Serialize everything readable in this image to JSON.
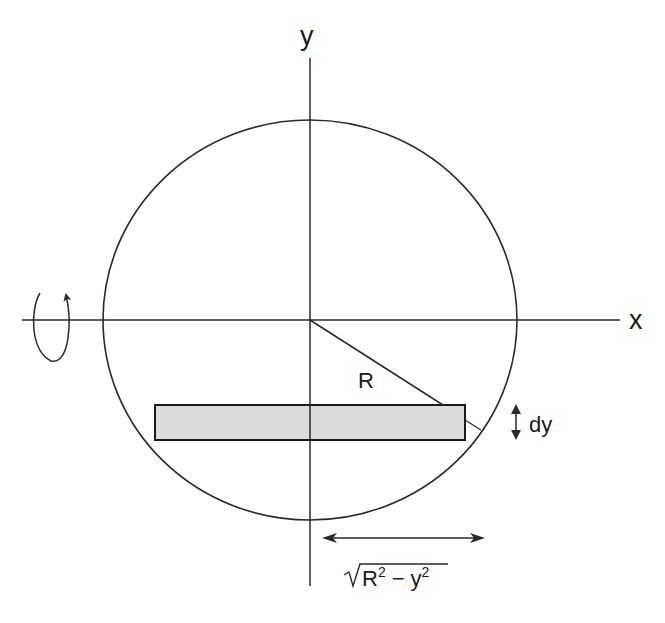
{
  "diagram": {
    "labels": {
      "y_axis": "y",
      "x_axis": "x",
      "radius": "R",
      "strip_thickness": "dy",
      "half_width_base": "R",
      "half_width_minus": "−",
      "half_width_y": "y",
      "exponent": "2"
    },
    "colors": {
      "stroke": "#2a2a2a",
      "strip_fill": "#dcdcdc",
      "background": "#ffffff"
    },
    "elements": [
      {
        "type": "circle",
        "center": [
          310,
          320
        ],
        "radius": 203
      },
      {
        "type": "axis",
        "name": "x",
        "from": [
          22,
          320
        ],
        "to": [
          620,
          320
        ]
      },
      {
        "type": "axis",
        "name": "y",
        "from": [
          310,
          58
        ],
        "to": [
          310,
          586
        ]
      },
      {
        "type": "radius_line",
        "from": [
          310,
          320
        ],
        "to": [
          443,
          405
        ]
      },
      {
        "type": "strip",
        "x": 155,
        "y": 405,
        "width": 310,
        "height": 35
      },
      {
        "type": "rotation_arrow",
        "around": "x-axis"
      },
      {
        "type": "double_arrow",
        "meaning": "dy",
        "vertical": true
      },
      {
        "type": "double_arrow",
        "meaning": "sqrt(R^2 - y^2)",
        "horizontal": true
      }
    ]
  }
}
